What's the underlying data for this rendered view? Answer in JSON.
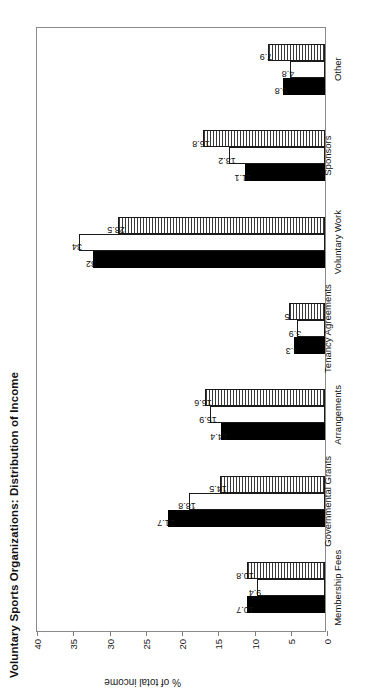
{
  "chart_data": {
    "type": "bar",
    "title": "Voluntary Sports Organizations: Distribution of Income",
    "xlabel": "",
    "ylabel": "% of total income",
    "ylim": [
      0,
      40
    ],
    "yticks": [
      "0",
      "5",
      "10",
      "15",
      "20",
      "25",
      "30",
      "35",
      "40"
    ],
    "grid": false,
    "legend": "none",
    "orientation": "rotated-90-ccw",
    "categories": [
      "Membership Fees",
      "Governmental Grants",
      "Arrangements",
      "Tenancy Agreements",
      "Voluntary Work",
      "Sponsors",
      "Other"
    ],
    "series": [
      {
        "name": "series-1",
        "fill": "solid-black",
        "color": "#000000",
        "values": [
          10.7,
          21.7,
          14.4,
          4.3,
          32,
          11.1,
          5.8
        ]
      },
      {
        "name": "series-2",
        "fill": "white-outline",
        "color": "#ffffff",
        "values": [
          9.4,
          18.8,
          15.9,
          3.9,
          34,
          13.2,
          4.8
        ]
      },
      {
        "name": "series-3",
        "fill": "horizontal-hatch",
        "color": "#3a3a3a",
        "values": [
          10.8,
          14.5,
          16.6,
          5,
          28.5,
          16.8,
          7.9
        ]
      }
    ],
    "value_labels": [
      [
        "10.7",
        "9.4",
        "10.8"
      ],
      [
        "21.7",
        "18.8",
        "14.5"
      ],
      [
        "14.4",
        "15.9",
        "16.6"
      ],
      [
        "4.3",
        "3.9",
        "5"
      ],
      [
        "32",
        "34",
        "28.5"
      ],
      [
        "11.1",
        "13.2",
        "16.8"
      ],
      [
        "5.8",
        "4.8",
        "7.9"
      ]
    ]
  }
}
